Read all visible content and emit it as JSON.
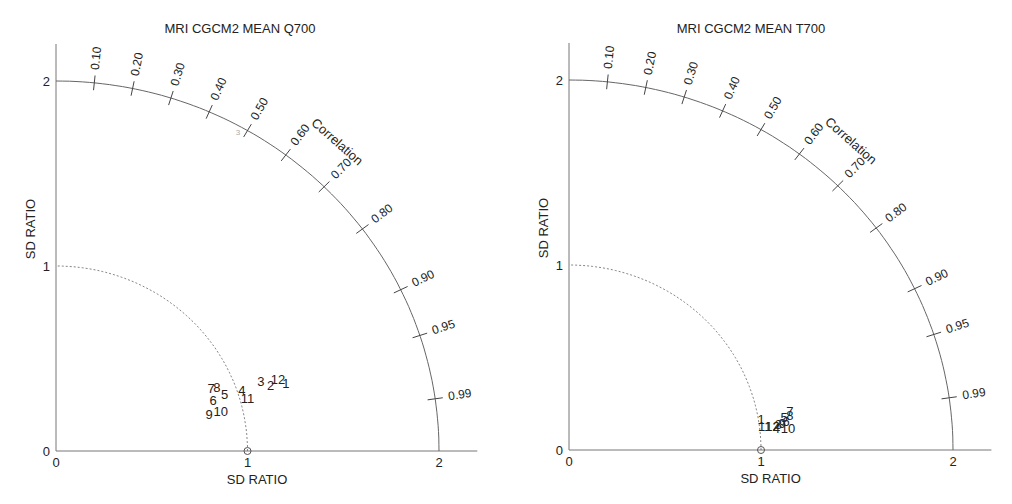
{
  "chart_data": [
    {
      "type": "scatter",
      "subtype": "taylor-diagram",
      "title": "MRI CGCM2 MEAN Q700",
      "xlabel": "SD RATIO",
      "ylabel": "SD RATIO",
      "arc_label": "Correlation",
      "xlim": [
        0,
        2.2
      ],
      "ylim": [
        0,
        2.2
      ],
      "x_ticks": [
        "0",
        "1",
        "2"
      ],
      "y_ticks": [
        "0",
        "1",
        "2"
      ],
      "correlation_ticks": [
        "0.10",
        "0.20",
        "0.30",
        "0.40",
        "0.50",
        "0.60",
        "0.70",
        "0.80",
        "0.90",
        "0.95",
        "0.99"
      ],
      "reference_point": {
        "x": 1,
        "y": 0
      },
      "reference_arc_radius": 1,
      "outer_arc_radius": 2,
      "points": [
        {
          "label": "1",
          "x": 1.2,
          "y": 0.36
        },
        {
          "label": "2",
          "x": 1.12,
          "y": 0.35
        },
        {
          "label": "3",
          "x": 1.07,
          "y": 0.37
        },
        {
          "label": "4",
          "x": 0.97,
          "y": 0.32
        },
        {
          "label": "5",
          "x": 0.88,
          "y": 0.3
        },
        {
          "label": "6",
          "x": 0.82,
          "y": 0.27
        },
        {
          "label": "7",
          "x": 0.81,
          "y": 0.33
        },
        {
          "label": "8",
          "x": 0.84,
          "y": 0.34
        },
        {
          "label": "9",
          "x": 0.8,
          "y": 0.19
        },
        {
          "label": "10",
          "x": 0.86,
          "y": 0.21
        },
        {
          "label": "11",
          "x": 1.0,
          "y": 0.28
        },
        {
          "label": "12",
          "x": 1.16,
          "y": 0.38
        }
      ],
      "stray_mark": {
        "label": "3",
        "x": 0.95,
        "y": 1.71
      }
    },
    {
      "type": "scatter",
      "subtype": "taylor-diagram",
      "title": "MRI CGCM2 MEAN T700",
      "xlabel": "SD RATIO",
      "ylabel": "SD RATIO",
      "arc_label": "Correlation",
      "xlim": [
        0,
        2.2
      ],
      "ylim": [
        0,
        2.2
      ],
      "x_ticks": [
        "0",
        "1",
        "2"
      ],
      "y_ticks": [
        "0",
        "1",
        "2"
      ],
      "correlation_ticks": [
        "0.10",
        "0.20",
        "0.30",
        "0.40",
        "0.50",
        "0.60",
        "0.70",
        "0.80",
        "0.90",
        "0.95",
        "0.99"
      ],
      "reference_point": {
        "x": 1,
        "y": 0
      },
      "reference_arc_radius": 1,
      "outer_arc_radius": 2,
      "points": [
        {
          "label": "1",
          "x": 1.0,
          "y": 0.16
        },
        {
          "label": "2",
          "x": 1.08,
          "y": 0.12
        },
        {
          "label": "3",
          "x": 1.09,
          "y": 0.13
        },
        {
          "label": "4",
          "x": 1.08,
          "y": 0.11
        },
        {
          "label": "5",
          "x": 1.12,
          "y": 0.17
        },
        {
          "label": "6",
          "x": 1.13,
          "y": 0.15
        },
        {
          "label": "7",
          "x": 1.15,
          "y": 0.2
        },
        {
          "label": "8",
          "x": 1.15,
          "y": 0.18
        },
        {
          "label": "9",
          "x": 1.11,
          "y": 0.14
        },
        {
          "label": "10",
          "x": 1.14,
          "y": 0.11
        },
        {
          "label": "11",
          "x": 1.02,
          "y": 0.12
        },
        {
          "label": "12",
          "x": 1.06,
          "y": 0.12
        }
      ]
    }
  ]
}
